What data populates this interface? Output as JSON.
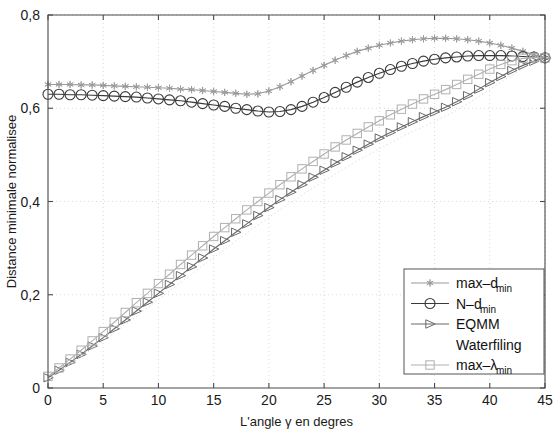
{
  "chart_data": {
    "type": "line",
    "title": "",
    "xlabel": "L'angle γ en degres",
    "ylabel": "Distance minimale normalisee",
    "xlim": [
      0,
      45
    ],
    "ylim": [
      0,
      0.8
    ],
    "xticks": [
      0,
      5,
      10,
      15,
      20,
      25,
      30,
      35,
      40,
      45
    ],
    "xticklabels": [
      "0",
      "5",
      "10",
      "15",
      "20",
      "25",
      "30",
      "35",
      "40",
      "45"
    ],
    "yticks": [
      0,
      0.2,
      0.4,
      0.6,
      0.8
    ],
    "yticklabels": [
      "0",
      "0,2",
      "0,4",
      "0,6",
      "0,8"
    ],
    "grid": true,
    "legend_position": "lower right",
    "x": [
      0,
      1,
      2,
      3,
      4,
      5,
      6,
      7,
      8,
      9,
      10,
      11,
      12,
      13,
      14,
      15,
      16,
      17,
      18,
      19,
      20,
      21,
      22,
      23,
      24,
      25,
      26,
      27,
      28,
      29,
      30,
      31,
      32,
      33,
      34,
      35,
      36,
      37,
      38,
      39,
      40,
      41,
      42,
      43,
      44,
      45
    ],
    "series": [
      {
        "name": "max–d",
        "name_sub": "min",
        "marker": "star",
        "color": "#9a9a9a",
        "values": [
          0.651,
          0.651,
          0.651,
          0.65,
          0.65,
          0.649,
          0.648,
          0.647,
          0.646,
          0.645,
          0.644,
          0.643,
          0.641,
          0.64,
          0.638,
          0.636,
          0.634,
          0.632,
          0.63,
          0.631,
          0.637,
          0.646,
          0.657,
          0.669,
          0.681,
          0.692,
          0.703,
          0.713,
          0.722,
          0.729,
          0.735,
          0.74,
          0.744,
          0.747,
          0.749,
          0.75,
          0.75,
          0.749,
          0.747,
          0.744,
          0.74,
          0.735,
          0.729,
          0.722,
          0.715,
          0.708
        ]
      },
      {
        "name": "N–d",
        "name_sub": "min",
        "marker": "circle",
        "color": "#3a3a3a",
        "values": [
          0.63,
          0.63,
          0.629,
          0.629,
          0.628,
          0.627,
          0.626,
          0.625,
          0.624,
          0.622,
          0.62,
          0.618,
          0.616,
          0.613,
          0.61,
          0.607,
          0.604,
          0.6,
          0.597,
          0.594,
          0.592,
          0.593,
          0.597,
          0.604,
          0.613,
          0.623,
          0.634,
          0.645,
          0.656,
          0.666,
          0.675,
          0.683,
          0.69,
          0.696,
          0.701,
          0.705,
          0.708,
          0.71,
          0.712,
          0.713,
          0.713,
          0.713,
          0.712,
          0.711,
          0.71,
          0.708
        ]
      },
      {
        "name": "EQMM",
        "name_sub": "",
        "marker": "triangle-right",
        "color": "#6a6a6a",
        "values": [
          0.022,
          0.038,
          0.055,
          0.072,
          0.09,
          0.108,
          0.127,
          0.146,
          0.165,
          0.184,
          0.203,
          0.222,
          0.241,
          0.26,
          0.279,
          0.298,
          0.316,
          0.334,
          0.352,
          0.37,
          0.387,
          0.404,
          0.42,
          0.436,
          0.452,
          0.467,
          0.482,
          0.496,
          0.51,
          0.523,
          0.536,
          0.548,
          0.56,
          0.571,
          0.582,
          0.592,
          0.602,
          0.614,
          0.627,
          0.641,
          0.655,
          0.668,
          0.681,
          0.692,
          0.701,
          0.708
        ]
      },
      {
        "name": "Waterfiling",
        "name_sub": "",
        "marker": "none",
        "color": "#d5d5d5",
        "values": [
          0.02,
          0.035,
          0.051,
          0.067,
          0.084,
          0.101,
          0.118,
          0.136,
          0.154,
          0.172,
          0.19,
          0.208,
          0.226,
          0.244,
          0.262,
          0.28,
          0.297,
          0.315,
          0.332,
          0.349,
          0.366,
          0.382,
          0.398,
          0.414,
          0.429,
          0.444,
          0.459,
          0.473,
          0.487,
          0.5,
          0.513,
          0.526,
          0.538,
          0.55,
          0.561,
          0.572,
          0.583,
          0.596,
          0.61,
          0.625,
          0.64,
          0.656,
          0.671,
          0.685,
          0.698,
          0.708
        ]
      },
      {
        "name": "max–λ",
        "name_sub": "min",
        "marker": "square",
        "color": "#b0b0b0",
        "values": [
          0.025,
          0.043,
          0.062,
          0.081,
          0.101,
          0.121,
          0.141,
          0.162,
          0.183,
          0.203,
          0.224,
          0.244,
          0.265,
          0.285,
          0.305,
          0.325,
          0.344,
          0.363,
          0.382,
          0.4,
          0.418,
          0.436,
          0.453,
          0.47,
          0.486,
          0.502,
          0.517,
          0.532,
          0.546,
          0.56,
          0.573,
          0.586,
          0.598,
          0.609,
          0.62,
          0.63,
          0.64,
          0.651,
          0.662,
          0.673,
          0.684,
          0.694,
          0.702,
          0.707,
          0.709,
          0.708
        ]
      }
    ],
    "legend_entries": [
      {
        "label": "max–d",
        "sub": "min",
        "marker": "star",
        "color": "#9a9a9a"
      },
      {
        "label": "N–d",
        "sub": "min",
        "marker": "circle",
        "color": "#3a3a3a"
      },
      {
        "label": "EQMM",
        "sub": "",
        "marker": "triangle-right",
        "color": "#6a6a6a"
      },
      {
        "label": "Waterfiling",
        "sub": "",
        "marker": "none",
        "color": "#e2e2e2"
      },
      {
        "label": "max–λ",
        "sub": "min",
        "marker": "square",
        "color": "#b0b0b0"
      }
    ]
  }
}
